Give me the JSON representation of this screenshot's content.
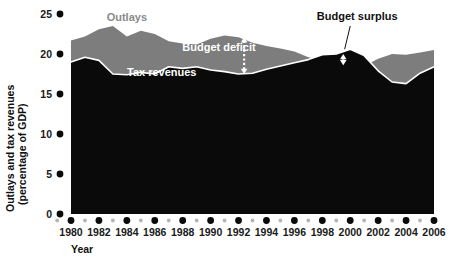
{
  "chart_data": {
    "type": "area",
    "title": "",
    "xlabel": "Year",
    "ylabel": "Outlays and tax revenues (percentage of GDP)",
    "xlim": [
      1980,
      2006
    ],
    "ylim": [
      0,
      25
    ],
    "grid": false,
    "legend_position": "inline-annotations",
    "ytick_labels": [
      "0",
      "5",
      "10",
      "15",
      "20",
      "25"
    ],
    "ytick_values": [
      0,
      5,
      10,
      15,
      20,
      25
    ],
    "xtick_labels": [
      "1980",
      "1982",
      "1984",
      "1986",
      "1988",
      "1990",
      "1992",
      "1994",
      "1996",
      "1998",
      "2000",
      "2002",
      "2004",
      "2006"
    ],
    "xtick_values": [
      1980,
      1982,
      1984,
      1986,
      1988,
      1990,
      1992,
      1994,
      1996,
      1998,
      2000,
      2002,
      2004,
      2006
    ],
    "minor_xtick_values": [
      1981,
      1983,
      1985,
      1987,
      1989,
      1991,
      1993,
      1995,
      1997,
      1999,
      2001,
      2003,
      2005
    ],
    "x": [
      1980,
      1981,
      1982,
      1983,
      1984,
      1985,
      1986,
      1987,
      1988,
      1989,
      1990,
      1991,
      1992,
      1993,
      1994,
      1995,
      1996,
      1997,
      1998,
      1999,
      2000,
      2001,
      2002,
      2003,
      2004,
      2005,
      2006
    ],
    "series": [
      {
        "name": "Outlays",
        "color": "#7d7d7d",
        "values": [
          21.7,
          22.2,
          23.1,
          23.5,
          22.2,
          22.9,
          22.5,
          21.6,
          21.3,
          21.2,
          21.9,
          22.3,
          22.1,
          21.4,
          21.0,
          20.7,
          20.3,
          19.6,
          19.2,
          18.6,
          18.4,
          18.5,
          19.4,
          20.0,
          19.9,
          20.2,
          20.5
        ]
      },
      {
        "name": "Tax revenues",
        "color": "#0a0a0a",
        "values": [
          19.0,
          19.6,
          19.2,
          17.5,
          17.4,
          17.7,
          17.5,
          18.4,
          18.2,
          18.4,
          18.0,
          17.8,
          17.5,
          17.6,
          18.1,
          18.5,
          18.9,
          19.3,
          19.9,
          20.0,
          20.6,
          19.8,
          17.9,
          16.5,
          16.3,
          17.6,
          18.4
        ]
      }
    ],
    "annotations": [
      {
        "name": "outlays-label",
        "text": "Outlays",
        "x": 1984.0,
        "y": 24.1,
        "color": "#8a8a8a"
      },
      {
        "name": "budget-deficit-label",
        "text": "Budget deficit",
        "x": 1990.6,
        "y": 20.4,
        "color": "#ffffff"
      },
      {
        "name": "budget-surplus-label",
        "text": "Budget surplus",
        "x": 2000.5,
        "y": 24.3,
        "color": "#101010"
      },
      {
        "name": "tax-revenues-label",
        "text": "Tax revenues",
        "x": 1986.5,
        "y": 17.2,
        "color": "#ffffff"
      }
    ],
    "arrows": [
      {
        "name": "budget-deficit-arrow",
        "x": 1992.4,
        "y_top": 22.1,
        "y_bottom": 17.5,
        "style": "dashed-double-arrow",
        "color": "#ffffff"
      },
      {
        "name": "budget-surplus-arrow",
        "x": 1999.5,
        "y_top": 20.0,
        "y_bottom": 18.6,
        "style": "dashed-double-arrow",
        "color": "#ffffff"
      },
      {
        "name": "budget-surplus-leader",
        "from_x": 2000.0,
        "from_y": 23.5,
        "to_x": 1999.6,
        "to_y": 20.6,
        "style": "line",
        "color": "#101010"
      }
    ]
  },
  "colors": {
    "outlays_band": "#7d7d7d",
    "tax_revenues_area": "#0a0a0a",
    "separator_line": "#ffffff",
    "tick_dot_major": "#0a0a0a",
    "tick_dot_minor": "#b5b5b5",
    "background": "#ffffff"
  }
}
